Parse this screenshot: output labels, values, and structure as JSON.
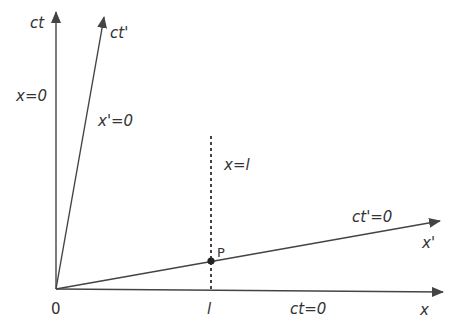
{
  "diagram": {
    "type": "spacetime (Minkowski) diagram",
    "colors": {
      "line": "#444444",
      "text": "#333333",
      "background": "#ffffff"
    },
    "origin": {
      "label": "0"
    },
    "axes": {
      "ct": {
        "label": "ct",
        "line_label": "x=0"
      },
      "ct_prime": {
        "label": "ct'",
        "line_label": "x'=0"
      },
      "x": {
        "label": "x",
        "line_label": "ct=0"
      },
      "x_prime": {
        "label": "x'",
        "line_label": "ct'=0"
      }
    },
    "dashed_line": {
      "label": "x=l",
      "foot_label": "l"
    },
    "point": {
      "label": "P"
    }
  }
}
